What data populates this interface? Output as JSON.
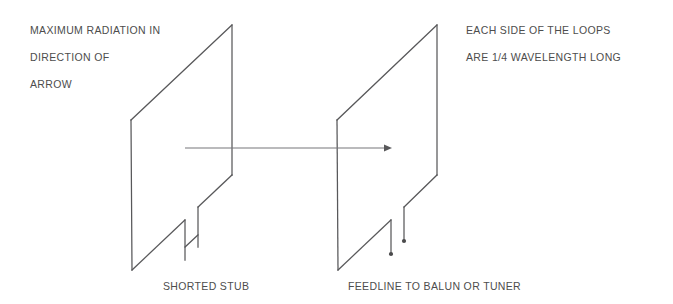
{
  "figure": {
    "title_hidden": "Quad loop antenna perspective diagram",
    "annotations": {
      "top_left": {
        "line1": "MAXIMUM RADIATION IN",
        "line2": "DIRECTION OF",
        "line3": "ARROW"
      },
      "top_right": {
        "line1": "EACH SIDE OF THE LOOPS",
        "line2": "ARE 1/4 WAVELENGTH LONG"
      },
      "bottom_left": "SHORTED STUB",
      "bottom_right": "FEEDLINE TO BALUN OR TUNER"
    },
    "colors": {
      "background": "#ffffff",
      "wire_stroke": "#58585a",
      "arrow_stroke": "#77777a",
      "text": "#4d4d4d",
      "terminal_dot": "#4a4a4c"
    },
    "elements": {
      "reflector_loop_label": "reflector loop with shorted stub",
      "driven_loop_label": "driven loop with feedline terminals",
      "direction_arrow_label": "maximum radiation direction arrow"
    },
    "geometry": {
      "loop_left": {
        "top_right_x": 232,
        "top_right_y": 25,
        "left_top_x": 131,
        "left_top_y": 120,
        "left_bottom_x": 132,
        "left_bottom_y": 270,
        "right_bottom_x": 232,
        "right_bottom_y": 175
      },
      "loop_right": {
        "top_right_x": 437,
        "top_right_y": 25,
        "left_top_x": 337,
        "left_top_y": 120,
        "left_bottom_x": 338,
        "left_bottom_y": 270,
        "right_bottom_x": 437,
        "right_bottom_y": 175
      },
      "arrow": {
        "start_x": 185,
        "start_y": 148,
        "end_x": 392,
        "end_y": 148
      }
    }
  }
}
